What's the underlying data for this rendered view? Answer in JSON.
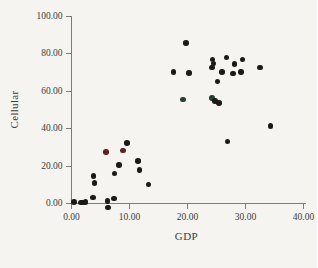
{
  "figure": {
    "background": "#f5f4f0",
    "text_color": "#3c3c3c",
    "axis_color": "#7d7d7d"
  },
  "chart_data": {
    "type": "scatter",
    "title": "",
    "xlabel": "GDP",
    "ylabel": "Cellular",
    "xlim": [
      0,
      40
    ],
    "ylim": [
      0,
      100
    ],
    "grid": false,
    "legend": false,
    "x_ticks": [
      {
        "value": 0,
        "label": "0.00"
      },
      {
        "value": 10,
        "label": "10.00"
      },
      {
        "value": 20,
        "label": "20.00"
      },
      {
        "value": 30,
        "label": "30.00"
      },
      {
        "value": 40,
        "label": "40.00"
      }
    ],
    "y_ticks": [
      {
        "value": 0,
        "label": "0.00"
      },
      {
        "value": 20,
        "label": "20.00"
      },
      {
        "value": 40,
        "label": "40.00"
      },
      {
        "value": 60,
        "label": "60.00"
      },
      {
        "value": 80,
        "label": "80.00"
      },
      {
        "value": 100,
        "label": "100.00"
      }
    ],
    "points": [
      {
        "x": 0.4,
        "y": 0.5
      },
      {
        "x": 1.6,
        "y": 0.3
      },
      {
        "x": 2.0,
        "y": 0.2
      },
      {
        "x": 2.4,
        "y": 0.4
      },
      {
        "x": 3.7,
        "y": 3.0
      },
      {
        "x": 3.8,
        "y": 14.4
      },
      {
        "x": 4.0,
        "y": 10.7
      },
      {
        "x": 5.9,
        "y": 27.3,
        "c": "maroon"
      },
      {
        "x": 6.2,
        "y": 1.0
      },
      {
        "x": 6.3,
        "y": -2.5
      },
      {
        "x": 7.3,
        "y": 2.5
      },
      {
        "x": 7.4,
        "y": 15.8
      },
      {
        "x": 8.2,
        "y": 20.3
      },
      {
        "x": 8.9,
        "y": 28.0,
        "c": "maroon"
      },
      {
        "x": 9.6,
        "y": 32.1
      },
      {
        "x": 11.5,
        "y": 22.5
      },
      {
        "x": 11.7,
        "y": 17.6
      },
      {
        "x": 13.3,
        "y": 10.0
      },
      {
        "x": 17.6,
        "y": 70.2
      },
      {
        "x": 19.2,
        "y": 55.4,
        "c": "green"
      },
      {
        "x": 19.7,
        "y": 85.7
      },
      {
        "x": 20.3,
        "y": 69.4
      },
      {
        "x": 24.2,
        "y": 72.4
      },
      {
        "x": 24.3,
        "y": 76.8
      },
      {
        "x": 24.5,
        "y": 74.5
      },
      {
        "x": 24.2,
        "y": 56.0,
        "c": "green"
      },
      {
        "x": 24.7,
        "y": 54.5
      },
      {
        "x": 25.4,
        "y": 53.5
      },
      {
        "x": 25.2,
        "y": 64.9
      },
      {
        "x": 25.9,
        "y": 69.9
      },
      {
        "x": 26.7,
        "y": 77.9
      },
      {
        "x": 26.9,
        "y": 32.8
      },
      {
        "x": 27.8,
        "y": 69.2
      },
      {
        "x": 28.1,
        "y": 74.3
      },
      {
        "x": 29.2,
        "y": 70.2
      },
      {
        "x": 29.5,
        "y": 76.8
      },
      {
        "x": 32.5,
        "y": 72.4
      },
      {
        "x": 34.3,
        "y": 41.3
      }
    ]
  },
  "colors": {
    "dot_default": "#1b1a19",
    "dot_maroon": "#5d2424",
    "dot_green": "#24432f"
  }
}
